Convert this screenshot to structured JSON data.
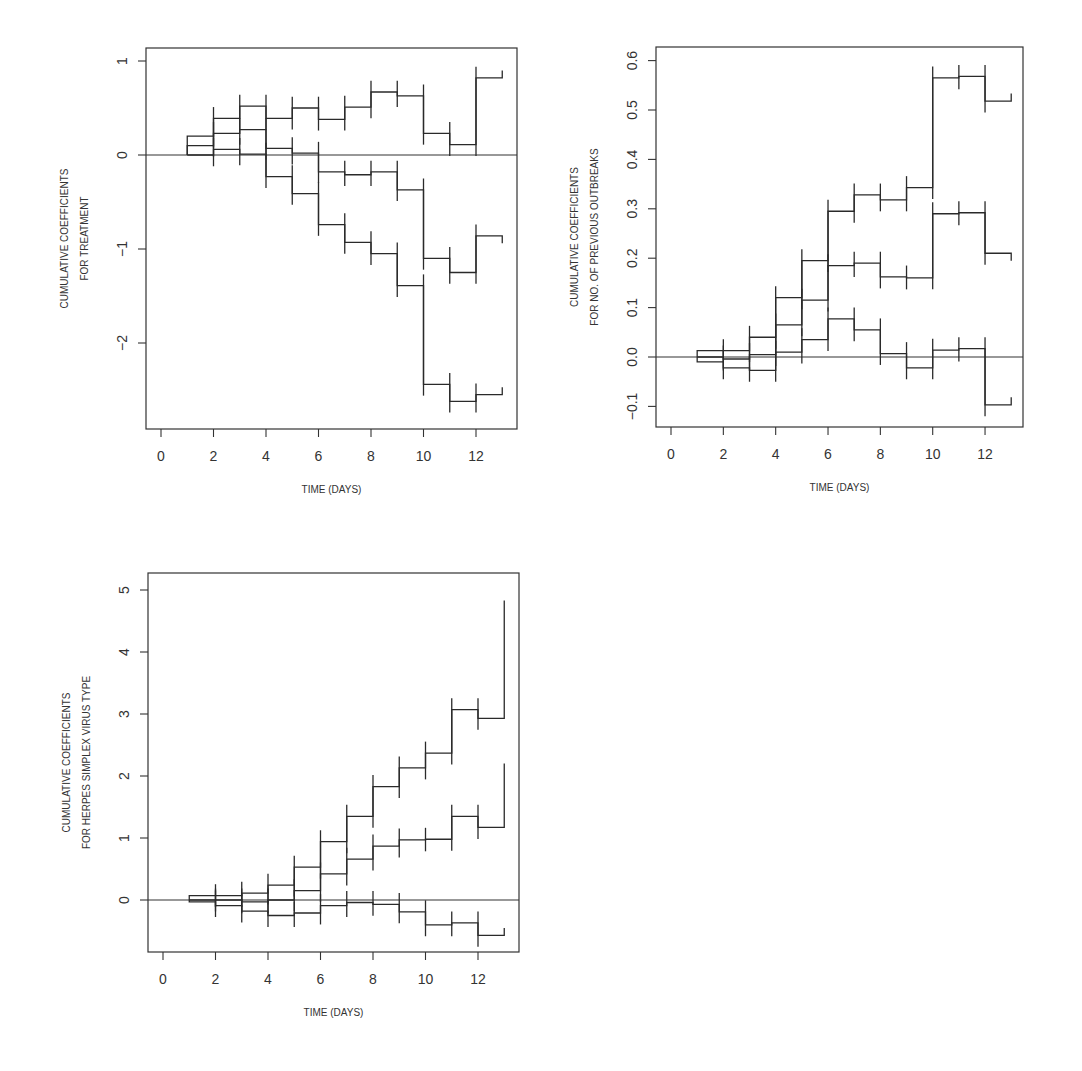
{
  "chart_data": [
    {
      "type": "line",
      "subtype": "step",
      "title": "",
      "xlabel": "TIME (DAYS)",
      "ylabel": [
        "CUMULATIVE COEFFICIENTS",
        "FOR TREATMENT"
      ],
      "xlim": [
        0,
        13
      ],
      "xticks": [
        0,
        2,
        4,
        6,
        8,
        10,
        12
      ],
      "ylim": [
        -2.9,
        1.1
      ],
      "yticks": [
        -2,
        -1,
        0,
        1
      ],
      "ytick_labels": [
        "−2",
        "−1",
        "0",
        "1"
      ],
      "grid": false,
      "reference_line": 0,
      "x_steps": [
        1,
        2,
        3,
        4,
        5,
        6,
        7,
        8,
        9,
        10,
        11,
        12,
        13
      ],
      "series": [
        {
          "name": "upper confidence bound",
          "values": [
            0.2,
            0.39,
            0.52,
            0.39,
            0.5,
            0.38,
            0.51,
            0.67,
            0.63,
            0.23,
            0.11,
            0.82
          ]
        },
        {
          "name": "estimate",
          "values": [
            0.1,
            0.23,
            0.27,
            0.07,
            0.02,
            -0.18,
            -0.21,
            -0.18,
            -0.37,
            -1.1,
            -1.25,
            -0.86
          ]
        },
        {
          "name": "lower confidence bound",
          "values": [
            0.0,
            0.06,
            0.01,
            -0.23,
            -0.41,
            -0.74,
            -0.93,
            -1.05,
            -1.39,
            -2.44,
            -2.62,
            -2.55
          ]
        }
      ]
    },
    {
      "type": "line",
      "subtype": "step",
      "title": "",
      "xlabel": "TIME (DAYS)",
      "ylabel": [
        "CUMULATIVE COEFFICIENTS",
        "FOR NO. OF PREVIOUS OUTBREAKS"
      ],
      "xlim": [
        0,
        13
      ],
      "xticks": [
        0,
        2,
        4,
        6,
        8,
        10,
        12
      ],
      "ylim": [
        -0.14,
        0.63
      ],
      "yticks": [
        -0.1,
        0.0,
        0.1,
        0.2,
        0.3,
        0.4,
        0.5,
        0.6
      ],
      "ytick_labels": [
        "−0.1",
        "0.0",
        "0.1",
        "0.2",
        "0.3",
        "0.4",
        "0.5",
        "0.6"
      ],
      "grid": false,
      "reference_line": 0,
      "x_steps": [
        1,
        2,
        3,
        4,
        5,
        6,
        7,
        8,
        9,
        10,
        11,
        12,
        13
      ],
      "series": [
        {
          "name": "upper confidence bound",
          "values": [
            0.013,
            0.013,
            0.04,
            0.12,
            0.195,
            0.295,
            0.328,
            0.318,
            0.343,
            0.565,
            0.568,
            0.518
          ]
        },
        {
          "name": "estimate",
          "values": [
            0.0,
            -0.004,
            0.005,
            0.065,
            0.115,
            0.185,
            0.19,
            0.162,
            0.16,
            0.29,
            0.292,
            0.21
          ]
        },
        {
          "name": "lower confidence bound",
          "values": [
            -0.01,
            -0.022,
            -0.027,
            0.01,
            0.035,
            0.077,
            0.055,
            0.007,
            -0.022,
            0.014,
            0.017,
            -0.097
          ]
        }
      ]
    },
    {
      "type": "line",
      "subtype": "step",
      "title": "",
      "xlabel": "TIME (DAYS)",
      "ylabel": [
        "CUMULATIVE COEFFICIENTS",
        "FOR HERPES SIMPLEX VIRUS TYPE"
      ],
      "xlim": [
        0,
        13
      ],
      "xticks": [
        0,
        2,
        4,
        6,
        8,
        10,
        12
      ],
      "ylim": [
        -0.85,
        5.3
      ],
      "yticks": [
        0,
        1,
        2,
        3,
        4,
        5
      ],
      "ytick_labels": [
        "0",
        "1",
        "2",
        "3",
        "4",
        "5"
      ],
      "grid": false,
      "reference_line": 0,
      "x_steps": [
        1,
        2,
        3,
        4,
        5,
        6,
        7,
        8,
        9,
        10,
        11,
        12,
        13
      ],
      "series": [
        {
          "name": "upper confidence bound",
          "values": [
            0.07,
            0.07,
            0.11,
            0.24,
            0.53,
            0.94,
            1.35,
            1.83,
            2.13,
            2.37,
            3.07,
            2.93
          ],
          "end_value": 4.83
        },
        {
          "name": "estimate",
          "values": [
            0.0,
            0.0,
            -0.03,
            0.0,
            0.15,
            0.42,
            0.66,
            0.87,
            0.97,
            0.98,
            1.35,
            1.17
          ],
          "end_value": 2.2
        },
        {
          "name": "lower confidence bound",
          "values": [
            -0.03,
            -0.09,
            -0.18,
            -0.25,
            -0.21,
            -0.09,
            -0.04,
            -0.07,
            -0.19,
            -0.4,
            -0.37,
            -0.57
          ],
          "end_value": -0.45
        }
      ]
    }
  ],
  "panels": [
    {
      "frame": {
        "left": 146,
        "top": 48,
        "right": 517,
        "bottom": 429
      },
      "x0_px": 161,
      "x_px_per_unit": 26.25,
      "y0_px": 155,
      "y_px_per_unit": 94
    },
    {
      "frame": {
        "left": 656,
        "top": 47,
        "right": 1023,
        "bottom": 427
      },
      "x0_px": 671,
      "x_px_per_unit": 26.17,
      "y0_px": 357,
      "y_px_per_unit": 494
    },
    {
      "frame": {
        "left": 148,
        "top": 573,
        "right": 519,
        "bottom": 952
      },
      "x0_px": 163,
      "x_px_per_unit": 26.25,
      "y0_px": 900,
      "y_px_per_unit": 62
    }
  ]
}
